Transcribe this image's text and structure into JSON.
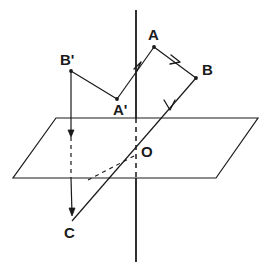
{
  "figure": {
    "stroke_color": "#1a1a1a",
    "background_color": "#ffffff",
    "labels": [
      {
        "id": "label-A",
        "text": "A",
        "x": 148,
        "y": 27
      },
      {
        "id": "label-B",
        "text": "B",
        "x": 202,
        "y": 62
      },
      {
        "id": "label-B-prime",
        "text": "B'",
        "x": 60,
        "y": 52
      },
      {
        "id": "label-A-prime",
        "text": "A'",
        "x": 113,
        "y": 102
      },
      {
        "id": "label-O",
        "text": "O",
        "x": 141,
        "y": 144
      },
      {
        "id": "label-C",
        "text": "C",
        "x": 64,
        "y": 225
      }
    ],
    "points": {
      "A": {
        "x": 154,
        "y": 47
      },
      "B": {
        "x": 196,
        "y": 78
      },
      "B_prime": {
        "x": 71,
        "y": 71
      },
      "A_prime": {
        "x": 117,
        "y": 99
      },
      "O": {
        "x": 136,
        "y": 155
      },
      "C": {
        "x": 72,
        "y": 221
      },
      "B_foot": {
        "x": 71,
        "y": 178
      }
    },
    "plane": {
      "name": "horizontal-plane-parallelogram",
      "corners": [
        {
          "x": 56,
          "y": 118
        },
        {
          "x": 258,
          "y": 118
        },
        {
          "x": 216,
          "y": 178
        },
        {
          "x": 13,
          "y": 178
        }
      ]
    },
    "axis": {
      "name": "vertical-axis-line",
      "x": 136,
      "y_top": 10,
      "y_bottom": 262,
      "dashed_from": 118,
      "dashed_to": 178
    },
    "segments": [
      {
        "id": "seg-Aprime-A",
        "from": "A_prime",
        "to": "A",
        "style": "solid",
        "tick": "single-arrow"
      },
      {
        "id": "seg-A-B",
        "from": "A",
        "to": "B",
        "style": "solid",
        "tick": "single-arrow"
      },
      {
        "id": "seg-B-C",
        "from": "B",
        "to": "C",
        "style": "solid",
        "tick": "single-arrow"
      },
      {
        "id": "seg-Bprime-Aprime",
        "from": "B_prime",
        "to": "A_prime",
        "style": "solid",
        "tick": "none"
      },
      {
        "id": "seg-Bprime-drop",
        "from": "B_prime",
        "to": "B_foot",
        "style": "solid-then-dashed",
        "tick": "arrowhead-down"
      },
      {
        "id": "seg-C-O-dashed",
        "from": "C",
        "to": "O",
        "style": "dashed",
        "tick": "none"
      }
    ]
  }
}
